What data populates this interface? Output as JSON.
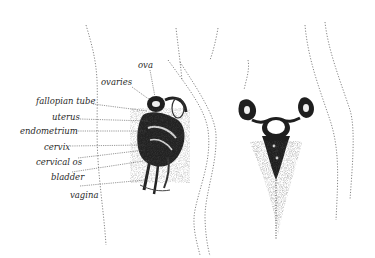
{
  "diagram": {
    "labels": [
      {
        "id": "ova",
        "text": "ova"
      },
      {
        "id": "ovaries",
        "text": "ovaries"
      },
      {
        "id": "fallopian-tube",
        "text": "fallopian tube"
      },
      {
        "id": "uterus",
        "text": "uterus"
      },
      {
        "id": "endometrium",
        "text": "endometrium"
      },
      {
        "id": "cervix",
        "text": "cervix"
      },
      {
        "id": "cervical-os",
        "text": "cervical os"
      },
      {
        "id": "bladder",
        "text": "bladder"
      },
      {
        "id": "vagina",
        "text": "vagina"
      }
    ],
    "colors": {
      "background": "#ffffff",
      "ink": "#1e1e1e",
      "stipple": "#6b6b6b"
    }
  }
}
